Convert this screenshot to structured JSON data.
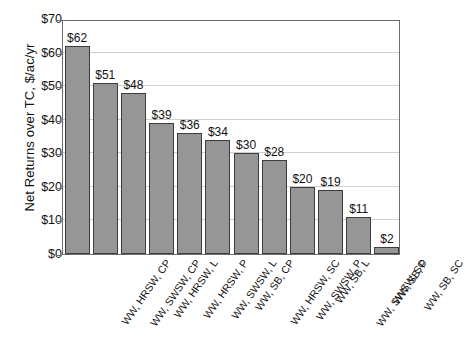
{
  "chart_data": {
    "type": "bar",
    "title": "",
    "xlabel": "",
    "ylabel": "Net Returns over TC, $/ac/yr",
    "ylim": [
      0,
      70
    ],
    "ytick_step": 10,
    "ytick_labels": [
      "$70",
      "$60",
      "$50",
      "$40",
      "$30",
      "$20",
      "$10",
      "$0"
    ],
    "ytick_values": [
      70,
      60,
      50,
      40,
      30,
      20,
      10,
      0
    ],
    "grid": true,
    "legend": false,
    "bar_color": "#969696",
    "bar_border_color": "#3d3d3d",
    "gridline_color": "#cfcfcf",
    "axis_color": "#6d6d6d",
    "categories": [
      "WW, HRSW, CP",
      "WW, SWSW, CP",
      "WW, HRSW, L",
      "WW, HRSW, P",
      "WW, SWSW, L",
      "WW, SB, CP",
      "WW, HRSW, SC",
      "WW, SWSW, P",
      "WW, SB, L",
      "WW, SWSW, SC",
      "WW, SB, P",
      "WW, SB, SC"
    ],
    "values": [
      62,
      51,
      48,
      39,
      36,
      34,
      30,
      28,
      20,
      19,
      11,
      2
    ],
    "value_labels": [
      "$62",
      "$51",
      "$48",
      "$39",
      "$36",
      "$34",
      "$30",
      "$28",
      "$20",
      "$19",
      "$11",
      "$2"
    ]
  }
}
